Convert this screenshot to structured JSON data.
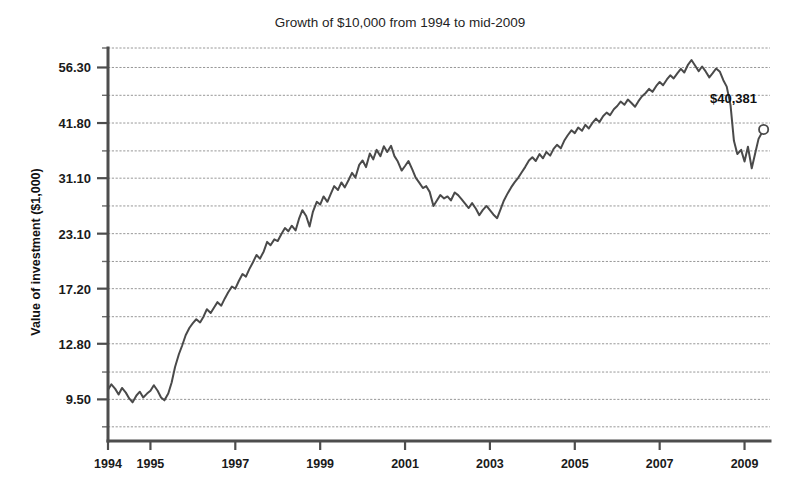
{
  "chart_data": {
    "type": "line",
    "title": "Growth of $10,000 from 1994 to mid-2009",
    "xlabel": "",
    "ylabel": "Value of investment ($1,000)",
    "yscale": "log",
    "ylim": [
      7.6,
      62.5
    ],
    "xlim": [
      1994.0,
      2009.6
    ],
    "grid": true,
    "legend": false,
    "ytick_labels": [
      "56.30",
      "41.80",
      "31.10",
      "23.10",
      "17.20",
      "12.80",
      "9.50"
    ],
    "ytick_values": [
      56.3,
      41.8,
      31.1,
      23.1,
      17.2,
      12.8,
      9.5
    ],
    "ygrid_values": [
      62.5,
      56.3,
      48.5,
      41.8,
      36.0,
      31.1,
      26.8,
      23.1,
      19.9,
      17.2,
      14.8,
      12.8,
      11.0,
      9.5,
      8.2
    ],
    "xtick_labels": [
      "1994",
      "1995",
      "1997",
      "1999",
      "2001",
      "2003",
      "2005",
      "2007",
      "2009"
    ],
    "xtick_values": [
      1994,
      1995,
      1997,
      1999,
      2001,
      2003,
      2005,
      2007,
      2009
    ],
    "annotation": {
      "label": "$40,381",
      "x": 2009.45,
      "y": 40.381,
      "marker": "open-circle"
    },
    "line_color": "#4a4a4a",
    "grid_color": "#8c8c8c",
    "axis_color": "#4d4d4d",
    "series": [
      {
        "name": "Value of investment",
        "x": [
          1994.0,
          1994.08,
          1994.17,
          1994.25,
          1994.33,
          1994.42,
          1994.5,
          1994.58,
          1994.67,
          1994.75,
          1994.83,
          1994.92,
          1995.0,
          1995.08,
          1995.17,
          1995.25,
          1995.33,
          1995.42,
          1995.5,
          1995.58,
          1995.67,
          1995.75,
          1995.83,
          1995.92,
          1996.0,
          1996.08,
          1996.17,
          1996.25,
          1996.33,
          1996.42,
          1996.5,
          1996.58,
          1996.67,
          1996.75,
          1996.83,
          1996.92,
          1997.0,
          1997.08,
          1997.17,
          1997.25,
          1997.33,
          1997.42,
          1997.5,
          1997.58,
          1997.67,
          1997.75,
          1997.83,
          1997.92,
          1998.0,
          1998.08,
          1998.17,
          1998.25,
          1998.33,
          1998.42,
          1998.5,
          1998.58,
          1998.67,
          1998.75,
          1998.83,
          1998.92,
          1999.0,
          1999.08,
          1999.17,
          1999.25,
          1999.33,
          1999.42,
          1999.5,
          1999.58,
          1999.67,
          1999.75,
          1999.83,
          1999.92,
          2000.0,
          2000.08,
          2000.17,
          2000.25,
          2000.33,
          2000.42,
          2000.5,
          2000.58,
          2000.67,
          2000.75,
          2000.83,
          2000.92,
          2001.0,
          2001.08,
          2001.17,
          2001.25,
          2001.33,
          2001.42,
          2001.5,
          2001.58,
          2001.67,
          2001.75,
          2001.83,
          2001.92,
          2002.0,
          2002.08,
          2002.17,
          2002.25,
          2002.33,
          2002.42,
          2002.5,
          2002.58,
          2002.67,
          2002.75,
          2002.83,
          2002.92,
          2003.0,
          2003.08,
          2003.17,
          2003.25,
          2003.33,
          2003.42,
          2003.5,
          2003.58,
          2003.67,
          2003.75,
          2003.83,
          2003.92,
          2004.0,
          2004.08,
          2004.17,
          2004.25,
          2004.33,
          2004.42,
          2004.5,
          2004.58,
          2004.67,
          2004.75,
          2004.83,
          2004.92,
          2005.0,
          2005.08,
          2005.17,
          2005.25,
          2005.33,
          2005.42,
          2005.5,
          2005.58,
          2005.67,
          2005.75,
          2005.83,
          2005.92,
          2006.0,
          2006.08,
          2006.17,
          2006.25,
          2006.33,
          2006.42,
          2006.5,
          2006.58,
          2006.67,
          2006.75,
          2006.83,
          2006.92,
          2007.0,
          2007.08,
          2007.17,
          2007.25,
          2007.33,
          2007.42,
          2007.5,
          2007.58,
          2007.67,
          2007.75,
          2007.83,
          2007.92,
          2008.0,
          2008.08,
          2008.17,
          2008.25,
          2008.33,
          2008.42,
          2008.5,
          2008.58,
          2008.67,
          2008.75,
          2008.83,
          2008.92,
          2009.0,
          2009.08,
          2009.17,
          2009.25,
          2009.33,
          2009.45
        ],
        "y": [
          10.0,
          10.3,
          10.05,
          9.75,
          10.1,
          9.85,
          9.55,
          9.35,
          9.7,
          9.9,
          9.6,
          9.8,
          9.95,
          10.25,
          9.95,
          9.6,
          9.45,
          9.8,
          10.4,
          11.3,
          12.1,
          12.7,
          13.4,
          13.95,
          14.3,
          14.6,
          14.35,
          14.8,
          15.4,
          15.1,
          15.55,
          16.0,
          15.7,
          16.3,
          16.85,
          17.4,
          17.2,
          17.9,
          18.6,
          18.35,
          19.1,
          19.85,
          20.6,
          20.2,
          21.0,
          22.1,
          21.7,
          22.4,
          22.2,
          23.0,
          23.8,
          23.4,
          24.1,
          23.5,
          25.0,
          26.2,
          25.4,
          24.0,
          26.0,
          27.4,
          27.0,
          28.2,
          27.4,
          28.6,
          29.8,
          29.2,
          30.4,
          29.6,
          30.8,
          32.0,
          31.2,
          33.4,
          34.2,
          33.0,
          35.5,
          34.4,
          36.2,
          35.0,
          36.9,
          35.8,
          37.0,
          35.0,
          34.0,
          32.4,
          33.2,
          34.1,
          32.6,
          31.2,
          30.4,
          29.5,
          29.8,
          28.9,
          26.8,
          27.6,
          28.4,
          27.9,
          28.2,
          27.6,
          28.8,
          28.4,
          27.8,
          27.1,
          26.5,
          27.2,
          26.4,
          25.5,
          26.2,
          26.8,
          26.2,
          25.6,
          25.1,
          26.3,
          27.6,
          28.7,
          29.6,
          30.4,
          31.2,
          32.1,
          33.0,
          34.2,
          34.8,
          34.1,
          35.4,
          34.6,
          35.8,
          35.1,
          36.4,
          37.2,
          36.5,
          38.0,
          39.1,
          40.2,
          39.6,
          40.8,
          40.1,
          41.4,
          40.6,
          41.9,
          42.8,
          42.0,
          43.4,
          44.2,
          43.6,
          45.0,
          45.8,
          46.9,
          46.1,
          47.4,
          46.6,
          45.6,
          47.0,
          48.2,
          49.1,
          50.2,
          49.4,
          51.0,
          52.1,
          51.2,
          52.8,
          54.0,
          53.1,
          54.6,
          55.9,
          54.8,
          57.2,
          58.6,
          57.0,
          55.2,
          56.6,
          55.2,
          53.4,
          54.6,
          56.0,
          55.0,
          52.6,
          50.8,
          46.0,
          38.0,
          35.4,
          36.2,
          34.0,
          36.8,
          32.8,
          35.5,
          38.4,
          40.381
        ]
      }
    ]
  },
  "annotation_text": "$40,381",
  "title_text": "Growth of $10,000 from 1994 to mid-2009",
  "ylabel_text": "Value of investment ($1,000)"
}
